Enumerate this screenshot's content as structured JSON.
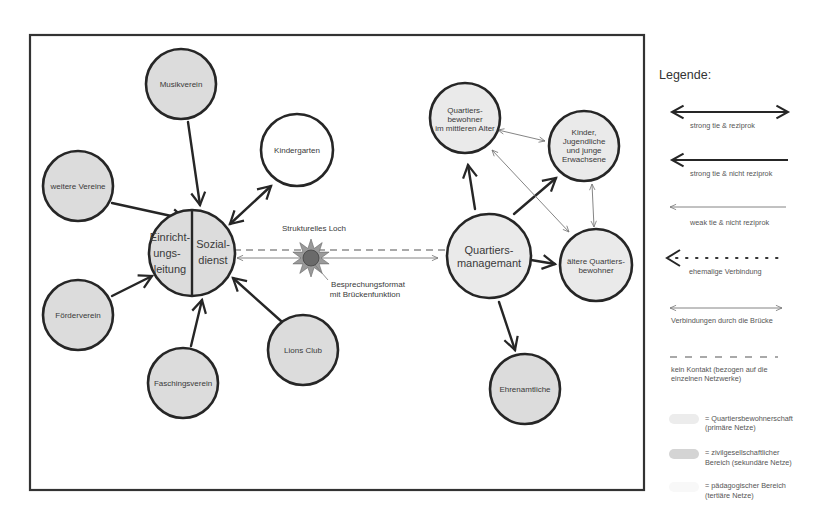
{
  "diagram": {
    "annotations": {
      "structural_hole": "Strukturelles Loch",
      "bridge_line1": "Besprechungsformat",
      "bridge_line2": "mit Brückenfunktion"
    },
    "central_node": {
      "left_lines": [
        "Einricht-",
        "ungs-",
        "leitung"
      ],
      "right_lines": [
        "Sozial-",
        "dienst"
      ]
    },
    "nodes": {
      "musikverein": "Musikverein",
      "kindergarten": "Kindergarten",
      "weitere_vereine": "weitere Vereine",
      "foerderverein": "Förderverein",
      "faschingsverein": "Faschingsverein",
      "lions_club": "Lions Club",
      "quartiersmanagement": [
        "Quartiers-",
        "managemant"
      ],
      "mittleres_alter": [
        "Quartiers-",
        "bewohner",
        "im mittleren Alter"
      ],
      "kinder": [
        "Kinder,",
        "Jugendliche",
        "und junge",
        "Erwachsene"
      ],
      "aeltere": [
        "ältere Quartiers-",
        "bewohner"
      ],
      "ehrenamtliche": "Ehrenamtliche"
    }
  },
  "legend": {
    "title": "Legende:",
    "items": [
      {
        "label": "strong tie & reziprok"
      },
      {
        "label": "strong tie & nicht reziprok"
      },
      {
        "label": "weak tie & nicht reziprok"
      },
      {
        "label": "ehemalige Verbindung"
      },
      {
        "label": "Verbindungen durch die Brücke"
      },
      {
        "label_lines": [
          "kein Kontakt (bezogen auf die",
          "einzelnen Netzwerke)"
        ]
      }
    ],
    "swatches": [
      {
        "lines": [
          "= Quartiersbewohnerschaft",
          "(primäre Netze)"
        ],
        "color": "#ececec"
      },
      {
        "lines": [
          "= zivilgesellschaftlicher",
          "Bereich (sekundäre Netze)"
        ],
        "color": "#d4d4d4"
      },
      {
        "lines": [
          "= pädagogischer Bereich",
          "(tertiäre Netze)"
        ],
        "color": "#f8f8f8"
      }
    ]
  }
}
